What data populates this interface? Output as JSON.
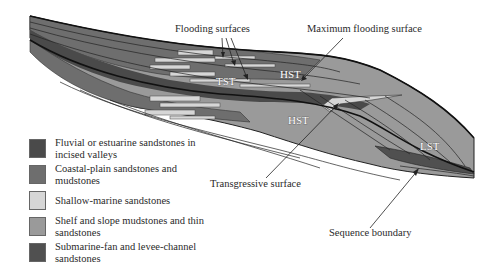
{
  "diagram": {
    "type": "sequence-stratigraphy-cross-section",
    "labels": {
      "flooding_surfaces": "Flooding surfaces",
      "maximum_flooding_surface": "Maximum flooding surface",
      "transgressive_surface": "Transgressive surface",
      "sequence_boundary": "Sequence boundary"
    },
    "systems_tracts": {
      "tst": "TST",
      "hst_upper": "HST",
      "hst_lower": "HST",
      "lst": "LST"
    },
    "legend": [
      {
        "label": "Fluvial or estuarine sandstones in incised valleys",
        "color": "#4a4a4a"
      },
      {
        "label": "Coastal-plain sandstones and mudstones",
        "color": "#6e6e6e"
      },
      {
        "label": "Shallow-marine sandstones",
        "color": "#d6d6d6"
      },
      {
        "label": "Shelf and slope mudstones and thin sandstones",
        "color": "#9a9a9a"
      },
      {
        "label": "Submarine-fan and levee-channel sandstones",
        "color": "#505050"
      }
    ]
  }
}
